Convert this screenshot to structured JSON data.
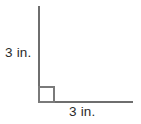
{
  "figure": {
    "type": "geometry-diagram",
    "canvas": {
      "width": 141,
      "height": 124,
      "background_color": "#ffffff"
    },
    "stroke_color": "#6e6e6e",
    "marker_color": "#7a7a7a",
    "text_color": "#2b2b2b",
    "vertical_leg": {
      "label": "3 in.",
      "value": 3,
      "unit": "in."
    },
    "horizontal_leg": {
      "label": "3 in.",
      "value": 3,
      "unit": "in."
    },
    "right_angle_marker": {
      "name": "right-angle-square",
      "degrees": 90
    }
  }
}
